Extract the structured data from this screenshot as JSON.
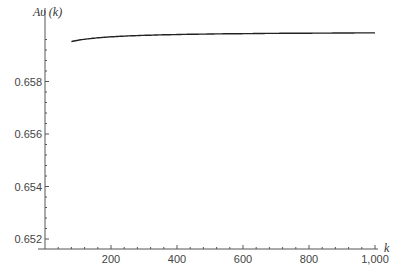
{
  "chart_data": {
    "type": "line",
    "title": "",
    "xlabel": "k",
    "ylabel": "Aυ (k)",
    "xlim": [
      0,
      1000
    ],
    "ylim": [
      0.6516,
      0.6597
    ],
    "x_ticks": [
      200,
      400,
      600,
      800,
      1000
    ],
    "x_tick_labels": [
      "200",
      "400",
      "600",
      "800",
      "1,000"
    ],
    "y_ticks": [
      0.652,
      0.654,
      0.656,
      0.658
    ],
    "y_tick_labels": [
      "0.652",
      "0.654",
      "0.656",
      "0.658"
    ],
    "grid": false,
    "legend": null,
    "series": [
      {
        "name": "Aυ(k)",
        "x": [
          80,
          100,
          120,
          150,
          200,
          250,
          300,
          400,
          500,
          600,
          700,
          800,
          900,
          1000
        ],
        "values": [
          0.652,
          0.6533,
          0.6543,
          0.6553,
          0.6564,
          0.6571,
          0.6576,
          0.6583,
          0.6587,
          0.6589,
          0.6591,
          0.6593,
          0.6594,
          0.65954
        ]
      }
    ]
  }
}
